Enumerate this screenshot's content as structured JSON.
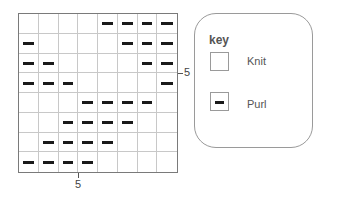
{
  "chart": {
    "columns": 8,
    "rows": 8,
    "pattern": [
      [
        0,
        0,
        0,
        0,
        1,
        1,
        1,
        1
      ],
      [
        1,
        0,
        0,
        0,
        0,
        1,
        1,
        1
      ],
      [
        1,
        1,
        0,
        0,
        0,
        0,
        1,
        1
      ],
      [
        1,
        1,
        1,
        0,
        0,
        0,
        0,
        1
      ],
      [
        0,
        0,
        0,
        1,
        1,
        1,
        1,
        0
      ],
      [
        0,
        0,
        1,
        1,
        1,
        1,
        0,
        0
      ],
      [
        0,
        1,
        1,
        1,
        1,
        0,
        0,
        0
      ],
      [
        1,
        1,
        1,
        1,
        0,
        0,
        0,
        0
      ]
    ],
    "bottom_axis_label": "5",
    "right_axis_label": "5"
  },
  "key": {
    "title": "key",
    "items": [
      {
        "symbol": "empty-square",
        "label": "Knit"
      },
      {
        "symbol": "dash-square",
        "label": "Purl"
      }
    ]
  }
}
